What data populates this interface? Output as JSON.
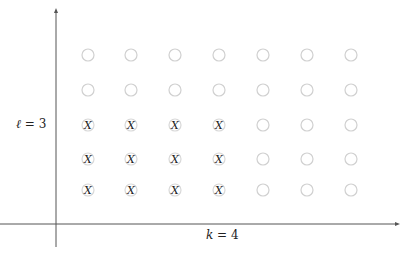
{
  "diagram": {
    "type": "lattice-grid",
    "y_label": {
      "var": "ℓ",
      "eq": " = 3"
    },
    "x_label": {
      "var": "k",
      "eq": " = 4"
    },
    "columns": 7,
    "rows": 5,
    "marked_columns": 4,
    "marked_rows": 3,
    "marker_text": "X",
    "column_x": [
      88,
      131,
      175,
      219,
      263,
      307,
      351
    ],
    "row_y": [
      55,
      90,
      125,
      159,
      190
    ],
    "colors": {
      "axis": "#555555",
      "empty_circle": "#d0d0d0",
      "marked_circle": "#d8d8d8",
      "marker": "#222222"
    }
  }
}
